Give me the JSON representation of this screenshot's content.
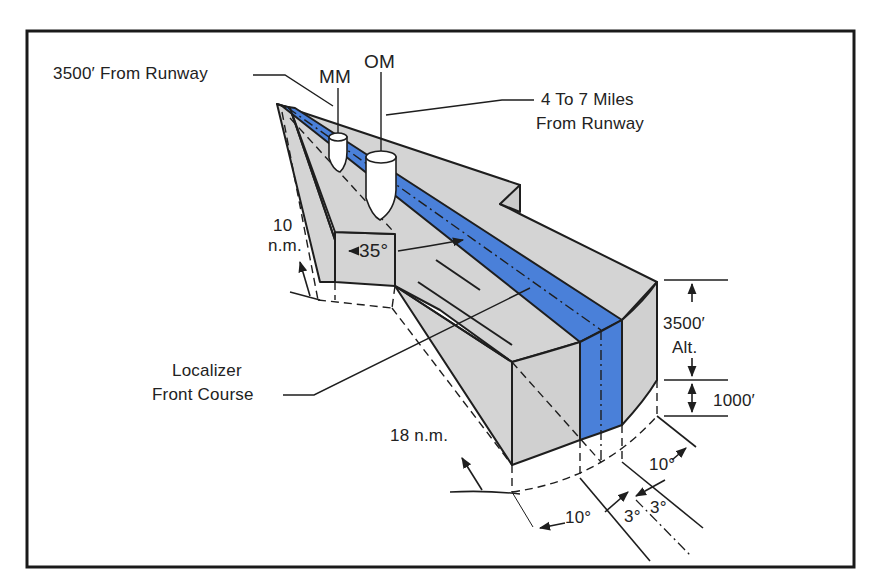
{
  "figure": {
    "colors": {
      "course_blue": "#4a80d9",
      "volume_grey": "#d4d4d4",
      "line": "#1e1e1e",
      "frame": "#1a1a1a",
      "background": "#ffffff"
    }
  },
  "labels": {
    "runway_distance": "3500′ From Runway",
    "middle_marker": "MM",
    "outer_marker": "OM",
    "outer_marker_distance_line1": "4 To 7 Miles",
    "outer_marker_distance_line2": "From Runway",
    "ten_nm_line1": "10",
    "ten_nm_line2": "n.m.",
    "angle_35": "35°",
    "localizer_line1": "Localizer",
    "localizer_line2": "Front Course",
    "eighteen_nm": "18 n.m.",
    "altitude_3500_line1": "3500′",
    "altitude_3500_line2": "Alt.",
    "altitude_1000": "1000′",
    "angle_10_right": "10°",
    "angle_10_left": "10°",
    "angle_3_left": "3°",
    "angle_3_right": "3°"
  }
}
